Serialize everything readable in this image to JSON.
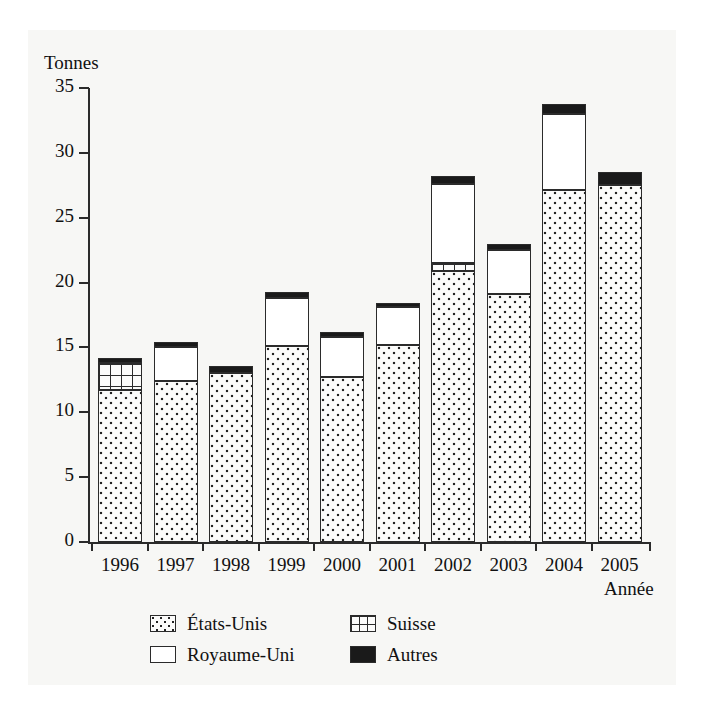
{
  "title": "1996-2005",
  "axes": {
    "ylabel": "Tonnes",
    "xlabel": "Année",
    "yticks": [
      0,
      5,
      10,
      15,
      20,
      25,
      30,
      35
    ]
  },
  "legend": [
    {
      "key": "etats-unis",
      "label": "États-Unis",
      "color": "#fbfbfa",
      "pattern": "dotted"
    },
    {
      "key": "suisse",
      "label": "Suisse",
      "color": "#fbfbfa",
      "pattern": "grid"
    },
    {
      "key": "royaume-uni",
      "label": "Royaume-Uni",
      "color": "#ffffff",
      "pattern": "solid-white"
    },
    {
      "key": "autres",
      "label": "Autres",
      "color": "#1a1a1a",
      "pattern": "solid-black"
    }
  ],
  "chart_data": {
    "type": "bar",
    "stacked": true,
    "title": "1996-2005",
    "xlabel": "Année",
    "ylabel": "Tonnes",
    "ylim": [
      0,
      35
    ],
    "grid": false,
    "legend_position": "bottom",
    "categories": [
      "1996",
      "1997",
      "1998",
      "1999",
      "2000",
      "2001",
      "2002",
      "2003",
      "2004",
      "2005"
    ],
    "series": [
      {
        "name": "États-Unis",
        "values": [
          11.7,
          12.4,
          13.0,
          15.1,
          12.7,
          15.2,
          20.9,
          19.1,
          27.1,
          27.5
        ]
      },
      {
        "name": "Suisse",
        "values": [
          2.1,
          0.0,
          0.0,
          0.0,
          0.0,
          0.0,
          0.6,
          0.0,
          0.0,
          0.0
        ]
      },
      {
        "name": "Royaume-Uni",
        "values": [
          0.0,
          2.6,
          0.0,
          3.7,
          3.1,
          2.9,
          6.1,
          3.4,
          5.9,
          0.0
        ]
      },
      {
        "name": "Autres",
        "values": [
          0.4,
          0.4,
          0.6,
          0.5,
          0.4,
          0.3,
          0.6,
          0.5,
          0.8,
          1.0
        ]
      }
    ],
    "totals": [
      14.2,
      15.4,
      13.6,
      19.3,
      16.2,
      18.4,
      28.2,
      23.0,
      33.8,
      28.5
    ]
  },
  "geometry": {
    "y_top_value": 35,
    "plot_height_px": 454,
    "bar_width_px": 44,
    "bar_step_px": 55.5,
    "bar_first_left_px": 10
  }
}
